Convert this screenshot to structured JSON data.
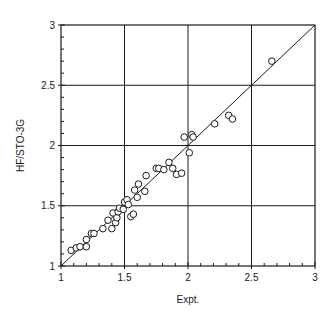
{
  "chart_data": {
    "type": "scatter",
    "title": "",
    "xlabel": "Expt.",
    "ylabel": "HF/STO-3G",
    "xlim": [
      1,
      3
    ],
    "ylim": [
      1,
      3
    ],
    "xticks": [
      1,
      1.5,
      2,
      2.5,
      3
    ],
    "yticks": [
      1,
      1.5,
      2,
      2.5,
      3
    ],
    "xtick_labels": [
      "1",
      "1.5",
      "2",
      "2.5",
      "3"
    ],
    "ytick_labels": [
      "1",
      "1.5",
      "2",
      "2.5",
      "3"
    ],
    "minor_tick_step": 0.1,
    "grid": true,
    "reference_line": {
      "name": "y = x",
      "from": [
        1,
        1
      ],
      "to": [
        3,
        3
      ]
    },
    "marker": "open-circle",
    "series": [
      {
        "name": "HF/STO-3G vs Expt.",
        "points": [
          [
            1.08,
            1.13
          ],
          [
            1.12,
            1.15
          ],
          [
            1.15,
            1.16
          ],
          [
            1.2,
            1.16
          ],
          [
            1.2,
            1.22
          ],
          [
            1.24,
            1.27
          ],
          [
            1.26,
            1.27
          ],
          [
            1.33,
            1.31
          ],
          [
            1.37,
            1.38
          ],
          [
            1.4,
            1.31
          ],
          [
            1.41,
            1.44
          ],
          [
            1.43,
            1.36
          ],
          [
            1.44,
            1.4
          ],
          [
            1.45,
            1.45
          ],
          [
            1.46,
            1.48
          ],
          [
            1.49,
            1.47
          ],
          [
            1.5,
            1.53
          ],
          [
            1.52,
            1.55
          ],
          [
            1.53,
            1.51
          ],
          [
            1.55,
            1.41
          ],
          [
            1.57,
            1.43
          ],
          [
            1.58,
            1.63
          ],
          [
            1.6,
            1.57
          ],
          [
            1.61,
            1.68
          ],
          [
            1.66,
            1.62
          ],
          [
            1.67,
            1.75
          ],
          [
            1.75,
            1.81
          ],
          [
            1.77,
            1.81
          ],
          [
            1.81,
            1.8
          ],
          [
            1.85,
            1.86
          ],
          [
            1.88,
            1.81
          ],
          [
            1.91,
            1.76
          ],
          [
            1.95,
            1.77
          ],
          [
            1.97,
            2.07
          ],
          [
            2.01,
            1.94
          ],
          [
            2.03,
            2.09
          ],
          [
            2.04,
            2.07
          ],
          [
            2.21,
            2.18
          ],
          [
            2.32,
            2.25
          ],
          [
            2.35,
            2.22
          ],
          [
            2.66,
            2.7
          ]
        ]
      }
    ]
  }
}
